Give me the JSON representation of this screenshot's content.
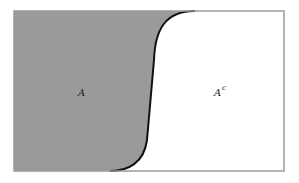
{
  "diagram": {
    "type": "set-complement-venn",
    "regions": [
      {
        "id": "A",
        "label": "A",
        "superscript": "",
        "fill": "#9a9a9a"
      },
      {
        "id": "A-complement",
        "label": "A",
        "superscript": "c",
        "fill": "#ffffff"
      }
    ],
    "boundary_color": "#111111",
    "frame_color": "#9a9a9a"
  }
}
